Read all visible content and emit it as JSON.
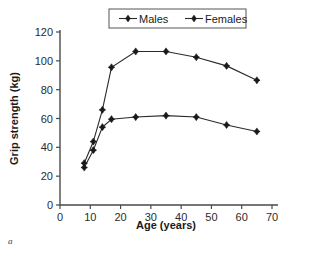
{
  "caption": "a",
  "chart_data": {
    "type": "line",
    "title": "",
    "xlabel": "Age (years)",
    "ylabel": "Grip strength (kg)",
    "xlim": [
      0,
      70
    ],
    "ylim": [
      0,
      120
    ],
    "xticks": [
      0,
      10,
      20,
      30,
      40,
      50,
      60,
      70
    ],
    "yticks": [
      0,
      20,
      40,
      60,
      80,
      100,
      120
    ],
    "grid": false,
    "legend_position": "top-center",
    "x": [
      8,
      11,
      14,
      17,
      25,
      35,
      45,
      55,
      65
    ],
    "series": [
      {
        "name": "Males",
        "marker": "diamond",
        "values": [
          29,
          44,
          66,
          95.5,
          106.5,
          106.5,
          102.5,
          96.5,
          86.5
        ]
      },
      {
        "name": "Females",
        "marker": "diamond",
        "values": [
          26,
          38,
          54,
          59.5,
          61,
          62,
          61,
          55.5,
          51
        ]
      }
    ]
  }
}
